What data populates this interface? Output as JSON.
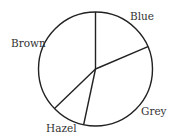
{
  "chart_data": {
    "type": "pie",
    "title": "",
    "categories": [
      "Blue",
      "Grey",
      "Hazel",
      "Brown"
    ],
    "values": [
      18.6,
      34.7,
      9.4,
      37.3
    ],
    "angles_deg": [
      67,
      125,
      34,
      134
    ],
    "start_angle_deg": 0,
    "direction": "clockwise",
    "unit": "percent (estimated from slice angles)",
    "legend": "none (labels placed outside slices)",
    "fill": "none (outline only)",
    "stroke_color": "#222222",
    "labels": [
      {
        "text": "Blue",
        "x": 130,
        "y": 20
      },
      {
        "text": "Grey",
        "x": 141,
        "y": 115
      },
      {
        "text": "Hazel",
        "x": 46,
        "y": 132
      },
      {
        "text": "Brown",
        "x": 11,
        "y": 47
      }
    ]
  },
  "geometry": {
    "cx": 95.5,
    "cy": 69,
    "r": 57
  },
  "colors": {
    "background": "#ffffff",
    "stroke": "#222222",
    "label": "#333333"
  }
}
